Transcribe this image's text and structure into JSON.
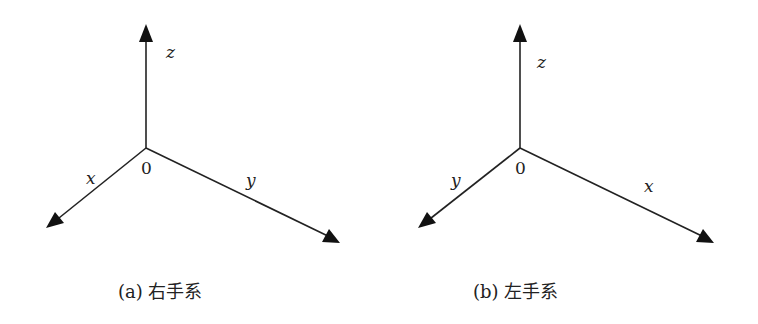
{
  "figure": {
    "panels": [
      {
        "id": "a",
        "caption": "(a) 右手系",
        "origin_label": "0",
        "axes": [
          {
            "name": "z",
            "label": "z",
            "direction": "up"
          },
          {
            "name": "x",
            "label": "x",
            "direction": "lower-left"
          },
          {
            "name": "y",
            "label": "y",
            "direction": "lower-right"
          }
        ]
      },
      {
        "id": "b",
        "caption": "(b) 左手系",
        "origin_label": "0",
        "axes": [
          {
            "name": "z",
            "label": "z",
            "direction": "up"
          },
          {
            "name": "y",
            "label": "y",
            "direction": "lower-left"
          },
          {
            "name": "x",
            "label": "x",
            "direction": "lower-right"
          }
        ]
      }
    ],
    "colors": {
      "line": "#222222",
      "background": "#ffffff"
    }
  }
}
